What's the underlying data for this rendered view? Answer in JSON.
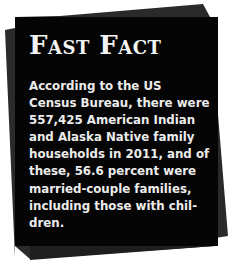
{
  "card": {
    "title": "Fast Fact",
    "body_lines": [
      "According to the US",
      "Census Bureau, there were",
      "557,425 American Indian",
      "and Alaska Native family",
      "households in 2011, and of",
      "these, 56.6 percent were",
      "married-couple families,",
      "including those with chil-",
      "dren."
    ],
    "colors": {
      "front_sheet": "#050505",
      "back_sheet": "#2a2a2a",
      "text": "#ececec",
      "background": "#ffffff"
    }
  }
}
